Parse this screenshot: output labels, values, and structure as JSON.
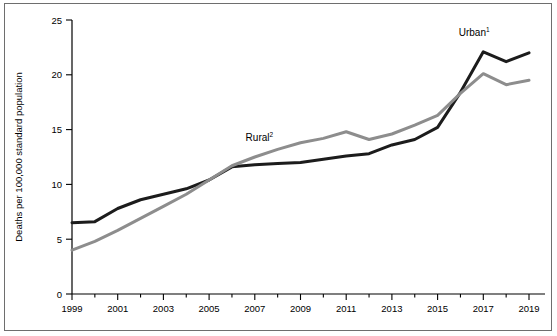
{
  "chart_data": {
    "type": "line",
    "title": "",
    "subtitle": "",
    "xlabel": "",
    "ylabel": "Deaths per 100,000 standard population",
    "xlim": [
      1999,
      2019
    ],
    "ylim": [
      0,
      25
    ],
    "grid": false,
    "legend_position": "inline-annotation",
    "x": [
      1999,
      2000,
      2001,
      2002,
      2003,
      2004,
      2005,
      2006,
      2007,
      2008,
      2009,
      2010,
      2011,
      2012,
      2013,
      2014,
      2015,
      2016,
      2017,
      2018,
      2019
    ],
    "ytick_labels": [
      "0",
      "5",
      "10",
      "15",
      "20",
      "25"
    ],
    "ytick_values": [
      0,
      5,
      10,
      15,
      20,
      25
    ],
    "xtick_labels": [
      "1999",
      "2001",
      "2003",
      "2005",
      "2007",
      "2009",
      "2011",
      "2013",
      "2015",
      "2017",
      "2019"
    ],
    "xtick_values": [
      1999,
      2001,
      2003,
      2005,
      2007,
      2009,
      2011,
      2013,
      2015,
      2017,
      2019
    ],
    "series": [
      {
        "name": "Urban",
        "label": "Urban",
        "superscript": "1",
        "color": "#1c1c1c",
        "values": [
          6.5,
          6.6,
          7.8,
          8.6,
          9.1,
          9.6,
          10.4,
          11.6,
          11.8,
          11.9,
          12.0,
          12.3,
          12.6,
          12.8,
          13.6,
          14.1,
          15.2,
          18.4,
          22.1,
          21.2,
          22.0
        ]
      },
      {
        "name": "Rural",
        "label": "Rural",
        "superscript": "2",
        "color": "#8d8d8d",
        "values": [
          4.0,
          4.8,
          5.8,
          6.9,
          8.0,
          9.1,
          10.4,
          11.7,
          12.5,
          13.2,
          13.8,
          14.2,
          14.8,
          14.1,
          14.6,
          15.4,
          16.3,
          18.3,
          20.1,
          19.1,
          19.5
        ]
      }
    ],
    "annotations": [
      {
        "text": "Urban",
        "superscript": "1",
        "x": 2016.6,
        "y": 23.5
      },
      {
        "text": "Rural",
        "superscript": "2",
        "x": 2007.2,
        "y": 14.0
      }
    ]
  },
  "figure": {
    "y_axis_title": "Deaths per 100,000 standard population"
  }
}
